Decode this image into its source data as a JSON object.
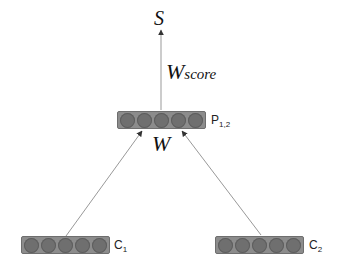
{
  "diagram": {
    "type": "neural-composition",
    "output": {
      "symbol": "S"
    },
    "score_weight": {
      "symbol": "W",
      "subscript": "score"
    },
    "composition_weight": {
      "symbol": "W"
    },
    "parent": {
      "label": "P",
      "subscript": "1,2",
      "cells": 5
    },
    "children": [
      {
        "label": "C",
        "subscript": "1",
        "cells": 5
      },
      {
        "label": "C",
        "subscript": "2",
        "cells": 5
      }
    ],
    "edges": [
      {
        "from": "C1",
        "to": "P1,2"
      },
      {
        "from": "C2",
        "to": "P1,2"
      },
      {
        "from": "P1,2",
        "to": "S"
      }
    ],
    "colors": {
      "vector_fill": "#8c8c8c",
      "cell_fill": "#6f6f6f",
      "edge": "#888888"
    }
  }
}
